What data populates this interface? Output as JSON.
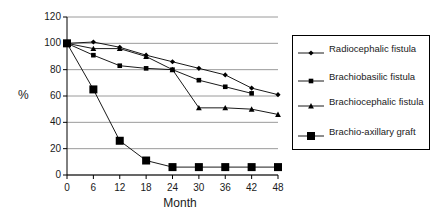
{
  "chart_data": {
    "type": "line",
    "title": "",
    "xlabel": "Month",
    "ylabel": "%",
    "x": [
      0,
      6,
      12,
      18,
      24,
      30,
      36,
      42,
      48
    ],
    "xlim": [
      0,
      48
    ],
    "ylim": [
      0,
      120
    ],
    "yticks": [
      0,
      20,
      40,
      60,
      80,
      100,
      120
    ],
    "xticks": [
      0,
      6,
      12,
      18,
      24,
      30,
      36,
      42,
      48
    ],
    "grid": "horizontal",
    "legend_position": "right",
    "series": [
      {
        "name": "Radiocephalic fistula",
        "marker": "diamond",
        "color": "#000000",
        "values": [
          100,
          101,
          97,
          91,
          86,
          81,
          76,
          66,
          61
        ]
      },
      {
        "name": "Brachiobasilic fistula",
        "marker": "square-small",
        "color": "#000000",
        "values": [
          100,
          91,
          83,
          81,
          80,
          72,
          67,
          62,
          null
        ]
      },
      {
        "name": "Brachiocephalic fistula",
        "marker": "triangle",
        "color": "#000000",
        "values": [
          100,
          96,
          96,
          90,
          80,
          51,
          51,
          50,
          46
        ]
      },
      {
        "name": "Brachio-axillary graft",
        "marker": "square-large",
        "color": "#000000",
        "values": [
          100,
          65,
          26,
          11,
          6,
          6,
          6,
          6,
          6
        ]
      }
    ]
  },
  "axes": {
    "y_title": "%",
    "x_title": "Month",
    "y_tick_labels": [
      "0",
      "20",
      "40",
      "60",
      "80",
      "100",
      "120"
    ],
    "x_tick_labels": [
      "0",
      "6",
      "12",
      "18",
      "24",
      "30",
      "36",
      "42",
      "48"
    ]
  },
  "legend": {
    "entries": [
      {
        "label": "Radiocephalic fistula",
        "marker": "diamond"
      },
      {
        "label": "Brachiobasilic fistula",
        "marker": "square-small"
      },
      {
        "label": "Brachiocephalic fistula",
        "marker": "triangle"
      },
      {
        "label": "Brachio-axillary graft",
        "marker": "square-large"
      }
    ]
  },
  "style": {
    "line_color": "#000000",
    "grid_color": "#808080",
    "axis_color": "#000000",
    "background": "#ffffff"
  }
}
